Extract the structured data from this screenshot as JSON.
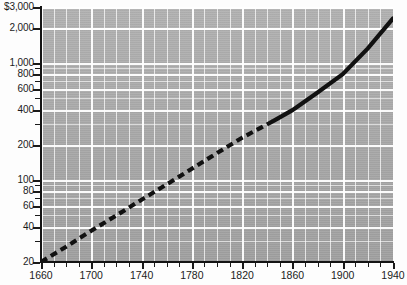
{
  "chart_data": {
    "type": "line",
    "title": "",
    "subtitle": "",
    "xlabel": "",
    "ylabel": "",
    "scale": {
      "x": "linear",
      "y": "log"
    },
    "xlim": [
      1660,
      1940
    ],
    "ylim": [
      20,
      3000
    ],
    "grid": true,
    "legend_position": "none",
    "x_tick_labels": [
      "1660",
      "1700",
      "1740",
      "1780",
      "1820",
      "1860",
      "1900",
      "1940"
    ],
    "x_tick_values": [
      1660,
      1700,
      1740,
      1780,
      1820,
      1860,
      1900,
      1940
    ],
    "x_minor_interval": 10,
    "y_tick_labels": [
      "$3,000",
      "2,000",
      "1,000",
      "800",
      "600",
      "400",
      "200",
      "100",
      "80",
      "60",
      "40",
      "20"
    ],
    "y_tick_values": [
      3000,
      2000,
      1000,
      800,
      600,
      400,
      200,
      100,
      80,
      60,
      40,
      20
    ],
    "series": [
      {
        "name": "trend",
        "style": "dashed",
        "color": "#111111",
        "x": [
          1660,
          1680,
          1700,
          1720,
          1740,
          1760,
          1780,
          1800,
          1820,
          1845
        ],
        "values": [
          20,
          27,
          37,
          50,
          68,
          92,
          125,
          170,
          230,
          320
        ]
      },
      {
        "name": "trend",
        "style": "solid",
        "color": "#111111",
        "x": [
          1845,
          1860,
          1880,
          1900,
          1920,
          1940
        ],
        "values": [
          320,
          395,
          560,
          800,
          1330,
          2400
        ]
      }
    ],
    "annotations": []
  },
  "axis": {
    "y_axis_name": "value-axis",
    "x_axis_name": "year-axis"
  }
}
